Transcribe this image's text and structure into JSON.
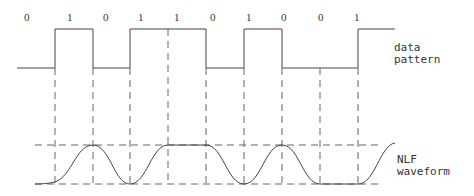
{
  "diagram": {
    "bits": [
      "0",
      "1",
      "0",
      "1",
      "1",
      "0",
      "1",
      "0",
      "0",
      "1"
    ],
    "labels": {
      "data_line1": "data",
      "data_line2": "pattern",
      "nlf_line1": "NLF",
      "nlf_line2": "waveform"
    },
    "colors": {
      "line": "#444444",
      "dash": "#666666",
      "text": "#333333",
      "background": "#ffffff"
    }
  }
}
